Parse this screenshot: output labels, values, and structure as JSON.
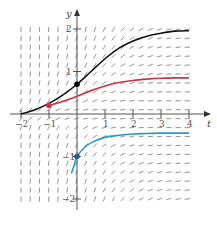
{
  "chart_data": {
    "type": "line",
    "title": "",
    "subtitle": "",
    "xlabel": "t",
    "ylabel": "y",
    "xlim": [
      -2,
      4
    ],
    "ylim": [
      -2,
      2
    ],
    "grid": false,
    "x_ticks": [
      -2,
      -1,
      1,
      2,
      3,
      4
    ],
    "x_tick_labels": [
      "−2",
      "−1",
      "1",
      "2",
      "3",
      "4"
    ],
    "y_ticks": [
      2,
      1,
      -1,
      -2
    ],
    "y_tick_labels": [
      "2",
      "1",
      "−1",
      "−2"
    ],
    "slope_field": {
      "t_range": [
        -2,
        4
      ],
      "y_range": [
        -2,
        2
      ],
      "t_step": 0.33,
      "y_step": 0.21,
      "color": "#888888",
      "description": "Slope marks: near-vertical on the left, flattening toward horizontal on the right; horizontal along y = 0"
    },
    "series": [
      {
        "name": "black-solution",
        "color": "#111111",
        "initial_point": {
          "t": 0,
          "y": 0.7
        },
        "x": [
          -2,
          -1.5,
          -1,
          -0.5,
          0,
          0.5,
          1,
          1.5,
          2,
          2.5,
          3,
          3.5,
          4
        ],
        "values": [
          0.0,
          0.1,
          0.25,
          0.45,
          0.7,
          1.0,
          1.3,
          1.55,
          1.72,
          1.83,
          1.9,
          1.95,
          1.96
        ]
      },
      {
        "name": "red-solution",
        "color": "#cc3344",
        "initial_point": {
          "t": -1,
          "y": 0.2
        },
        "x": [
          -1,
          -0.5,
          0,
          0.5,
          1,
          1.5,
          2,
          2.5,
          3,
          3.5,
          4
        ],
        "values": [
          0.2,
          0.3,
          0.42,
          0.55,
          0.66,
          0.74,
          0.79,
          0.82,
          0.84,
          0.85,
          0.85
        ]
      },
      {
        "name": "blue-solution",
        "color": "#2a9bc8",
        "initial_point": {
          "t": 0,
          "y": -1
        },
        "x": [
          -0.2,
          -0.1,
          0,
          0.25,
          0.5,
          1,
          1.5,
          2,
          2.5,
          3,
          3.5,
          4
        ],
        "values": [
          -1.4,
          -1.2,
          -1.0,
          -0.8,
          -0.68,
          -0.55,
          -0.5,
          -0.47,
          -0.46,
          -0.45,
          -0.45,
          -0.45
        ]
      }
    ],
    "legend": null,
    "annotations": []
  },
  "colors": {
    "axis": "#555555",
    "slope_marks": "#888888",
    "background": "#ffffff"
  }
}
